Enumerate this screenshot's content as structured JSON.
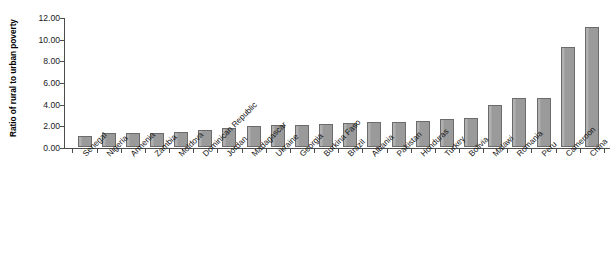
{
  "chart_data": {
    "type": "bar",
    "title": "",
    "xlabel": "",
    "ylabel": "Ratio of rural to urban poverty",
    "ylim": [
      0,
      12
    ],
    "ytick_step": 2,
    "ytick_labels": [
      "0.00",
      "2.00",
      "4.00",
      "6.00",
      "8.00",
      "10.00",
      "12.00"
    ],
    "ytick_values": [
      0,
      2,
      4,
      6,
      8,
      10,
      12
    ],
    "grid": false,
    "legend": "none",
    "bar_color": "#9a9a9a",
    "bar_border_color": "#6b6b6b",
    "axis_color": "#4d4d4d",
    "categories": [
      "Senegal",
      "Nigeria",
      "Armenia",
      "Zambia",
      "Moldova",
      "Dominican Republic",
      "Jordan",
      "Madagascar",
      "Ukraine",
      "Georgia",
      "Burkina Faso",
      "Brazil",
      "Albania",
      "Pakistan",
      "Honduras",
      "Turkey",
      "Bolivia",
      "Malawi",
      "Romania",
      "Peru",
      "Cameroon",
      "China"
    ],
    "values": [
      1.05,
      1.25,
      1.3,
      1.3,
      1.35,
      1.6,
      1.75,
      1.9,
      2.0,
      2.05,
      2.15,
      2.25,
      2.3,
      2.35,
      2.4,
      2.55,
      2.65,
      3.9,
      4.5,
      4.5,
      9.25,
      11.1
    ]
  }
}
